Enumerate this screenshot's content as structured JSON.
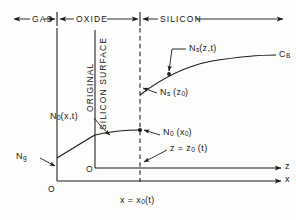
{
  "figure": {
    "regions": [
      {
        "name": "gas",
        "label": "GAS"
      },
      {
        "name": "oxide",
        "label": "OXIDE"
      },
      {
        "name": "silicon",
        "label": "SILICON"
      }
    ],
    "vertical_labels": [
      {
        "name": "original",
        "label": "ORIGINAL"
      },
      {
        "name": "silicon-surface",
        "label": "SILICON SURFACE"
      }
    ],
    "curve_labels": {
      "gas_concentration": "N",
      "gas_concentration_sub": "g",
      "oxide_profile_main": "N",
      "oxide_profile_sub": "0",
      "oxide_profile_arg": "(x,t)",
      "interface_value_main": "N",
      "interface_value_sub": "0",
      "interface_value_arg": " (x",
      "interface_value_sub2": "0",
      "interface_value_close": ")",
      "silicon_profile_main": "N",
      "silicon_profile_sub": "s",
      "silicon_profile_arg": "(z,t)",
      "silicon_surface_main": "N",
      "silicon_surface_sub": "s",
      "silicon_surface_arg": " (z",
      "silicon_surface_sub2": "0",
      "silicon_surface_close": ")",
      "bulk_main": "C",
      "bulk_sub": "B"
    },
    "axes": {
      "z_axis_label": "z",
      "x_axis_label": "x",
      "origin_x_label": "O",
      "origin_z_label": "O",
      "z_interface_main": "z = z",
      "z_interface_sub": "0",
      "z_interface_arg": " (t)",
      "x_interface_main": "x = x",
      "x_interface_sub": "0",
      "x_interface_arg": "(t)"
    },
    "colors": {
      "ink": "#1a1a1a",
      "background": "#fdfdfb"
    }
  }
}
